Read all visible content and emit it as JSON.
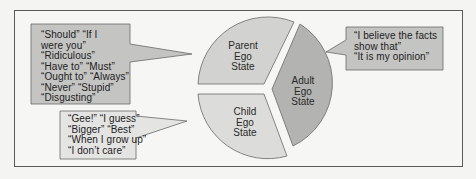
{
  "diagram": {
    "type": "ego-state-pie",
    "colors": {
      "parent_fill": "#d2d2d0",
      "adult_fill": "#b3b3b1",
      "child_fill": "#dcdcda",
      "callout_fill": "#c4c4c2",
      "child_callout_fill": "#e4e4e2",
      "stroke": "#6a6a6a",
      "frame_bg": "#f6f6f4"
    },
    "segments": [
      {
        "id": "parent",
        "label_lines": [
          "Parent",
          "Ego",
          "State"
        ]
      },
      {
        "id": "adult",
        "label_lines": [
          "Adult",
          "Ego",
          "State"
        ]
      },
      {
        "id": "child",
        "label_lines": [
          "Child",
          "Ego",
          "State"
        ]
      }
    ],
    "callouts": {
      "parent": {
        "lines": [
          "“Should” “If I",
          "were you”",
          "“Ridiculous”",
          "“Have to” “Must”",
          "“Ought to” “Always”",
          "“Never” “Stupid”",
          "“Disgusting”"
        ],
        "text": "“Should” “If I\nwere you”\n“Ridiculous”\n“Have to” “Must”\n“Ought to” “Always”\n“Never” “Stupid”\n“Disgusting”"
      },
      "child": {
        "lines": [
          "“Gee!” “I guess”",
          "“Bigger” “Best”",
          "“When I grow up”",
          "“I don’t care”"
        ],
        "text": "“Gee!” “I guess”\n“Bigger” “Best”\n“When I grow up”\n“I don’t care”"
      },
      "adult": {
        "lines": [
          "“I believe the facts",
          "show that”",
          "“It is my opinion”"
        ],
        "text": "“I believe the facts\nshow that”\n“It is my opinion”"
      }
    }
  }
}
